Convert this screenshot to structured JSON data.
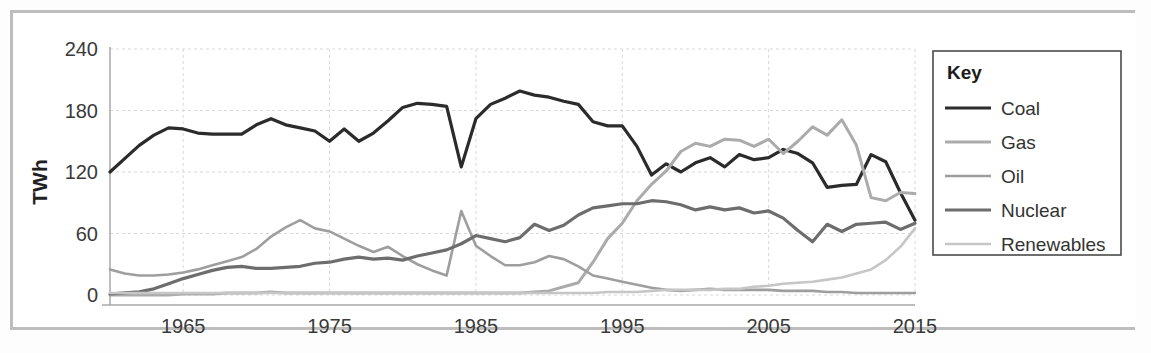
{
  "chart_data": {
    "type": "line",
    "title": "",
    "xlabel": "",
    "ylabel": "TWh",
    "xlim": [
      1960,
      2015
    ],
    "ylim": [
      0,
      240
    ],
    "grid": true,
    "legend_position": "right-outside",
    "legend_title": "Key",
    "x_ticks": [
      "1965",
      "1975",
      "1985",
      "1995",
      "2005",
      "2015"
    ],
    "x_tick_values": [
      1965,
      1975,
      1985,
      1995,
      2005,
      2015
    ],
    "y_ticks": [
      "0",
      "60",
      "120",
      "180",
      "240"
    ],
    "y_tick_values": [
      0,
      60,
      120,
      180,
      240
    ],
    "x": [
      1960,
      1961,
      1962,
      1963,
      1964,
      1965,
      1966,
      1967,
      1968,
      1969,
      1970,
      1971,
      1972,
      1973,
      1974,
      1975,
      1976,
      1977,
      1978,
      1979,
      1980,
      1981,
      1982,
      1983,
      1984,
      1985,
      1986,
      1987,
      1988,
      1989,
      1990,
      1991,
      1992,
      1993,
      1994,
      1995,
      1996,
      1997,
      1998,
      1999,
      2000,
      2001,
      2002,
      2003,
      2004,
      2005,
      2006,
      2007,
      2008,
      2009,
      2010,
      2011,
      2012,
      2013,
      2014,
      2015
    ],
    "series": [
      {
        "name": "Coal",
        "color": "#2b2b2b",
        "width": 3.2,
        "values": [
          120,
          133,
          146,
          156,
          163,
          162,
          158,
          157,
          157,
          157,
          166,
          172,
          166,
          163,
          160,
          150,
          162,
          150,
          158,
          170,
          183,
          187,
          186,
          184,
          125,
          172,
          186,
          192,
          199,
          195,
          193,
          189,
          186,
          169,
          165,
          165,
          145,
          117,
          128,
          120,
          129,
          134,
          125,
          137,
          132,
          134,
          142,
          138,
          129,
          105,
          107,
          108,
          137,
          130,
          100,
          73
        ]
      },
      {
        "name": "Gas",
        "color": "#ababab",
        "width": 3.0,
        "values": [
          0,
          0,
          0,
          0,
          0,
          1,
          1,
          1,
          2,
          2,
          2,
          3,
          2,
          2,
          2,
          2,
          2,
          2,
          2,
          2,
          2,
          2,
          2,
          2,
          2,
          2,
          2,
          2,
          2,
          3,
          4,
          8,
          12,
          32,
          55,
          70,
          92,
          108,
          121,
          140,
          148,
          145,
          152,
          151,
          145,
          152,
          138,
          150,
          164,
          156,
          171,
          146,
          95,
          92,
          100,
          99
        ]
      },
      {
        "name": "Oil",
        "color": "#9e9e9e",
        "width": 2.6,
        "values": [
          25,
          21,
          19,
          19,
          20,
          22,
          25,
          29,
          33,
          37,
          45,
          57,
          66,
          73,
          65,
          62,
          55,
          48,
          42,
          47,
          38,
          30,
          24,
          19,
          82,
          48,
          38,
          29,
          29,
          32,
          38,
          35,
          28,
          19,
          16,
          13,
          10,
          7,
          5,
          4,
          5,
          6,
          5,
          5,
          5,
          5,
          4,
          4,
          4,
          3,
          3,
          2,
          2,
          2,
          2,
          2
        ]
      },
      {
        "name": "Nuclear",
        "color": "#6d6d6d",
        "width": 3.2,
        "values": [
          1,
          2,
          3,
          6,
          11,
          16,
          20,
          24,
          27,
          28,
          26,
          26,
          27,
          28,
          31,
          32,
          35,
          37,
          35,
          36,
          34,
          38,
          41,
          44,
          50,
          58,
          55,
          52,
          56,
          69,
          63,
          68,
          78,
          85,
          87,
          89,
          89,
          92,
          91,
          88,
          83,
          86,
          83,
          85,
          80,
          82,
          75,
          63,
          52,
          69,
          62,
          69,
          70,
          71,
          64,
          70
        ]
      },
      {
        "name": "Renewables",
        "color": "#c6c6c6",
        "width": 2.6,
        "values": [
          2,
          2,
          2,
          2,
          2,
          2,
          2,
          2,
          2,
          2,
          2,
          2,
          2,
          2,
          2,
          2,
          2,
          2,
          2,
          2,
          2,
          2,
          2,
          2,
          2,
          2,
          2,
          2,
          2,
          2,
          2,
          2,
          2,
          2,
          3,
          3,
          3,
          4,
          5,
          5,
          5,
          5,
          6,
          6,
          8,
          9,
          11,
          12,
          13,
          15,
          17,
          21,
          25,
          34,
          47,
          65
        ]
      }
    ]
  },
  "legend": {
    "title": "Key",
    "items": [
      {
        "label": "Coal"
      },
      {
        "label": "Gas"
      },
      {
        "label": "Oil"
      },
      {
        "label": "Nuclear"
      },
      {
        "label": "Renewables"
      }
    ]
  },
  "axes": {
    "y_axis_label": "TWh"
  }
}
